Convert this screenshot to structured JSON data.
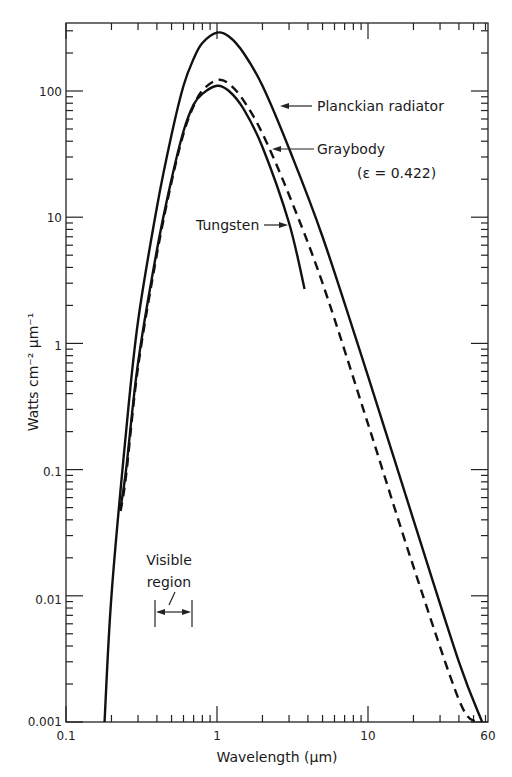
{
  "chart_data": {
    "type": "line",
    "title": "",
    "xlabel": "Wavelength (μm)",
    "ylabel": "Watts cm⁻² μm⁻¹",
    "xscale": "log",
    "yscale": "log",
    "xlim": [
      0.1,
      60
    ],
    "ylim": [
      0.001,
      300
    ],
    "grid": false,
    "x_tick_labels": [
      "0.1",
      "1",
      "10",
      "60"
    ],
    "y_tick_labels": [
      "0.001",
      "0.01",
      "0.1",
      "1",
      "10",
      "100"
    ],
    "series": [
      {
        "name": "Planckian radiator",
        "style": "solid",
        "x": [
          0.18,
          0.2,
          0.25,
          0.3,
          0.4,
          0.5,
          0.6,
          0.7,
          0.8,
          1.0,
          1.2,
          1.5,
          2.0,
          3.0,
          5.0,
          10,
          20,
          40,
          57
        ],
        "y": [
          0.001,
          0.01,
          0.2,
          1.5,
          12,
          45,
          110,
          180,
          240,
          290,
          270,
          200,
          110,
          35,
          7,
          0.55,
          0.04,
          0.003,
          0.001
        ]
      },
      {
        "name": "Graybody (ε = 0.422)",
        "style": "dashed",
        "x": [
          0.23,
          0.25,
          0.3,
          0.4,
          0.5,
          0.6,
          0.7,
          0.8,
          1.0,
          1.2,
          1.5,
          2.0,
          3.0,
          5.0,
          10,
          20,
          40,
          52
        ],
        "y": [
          0.047,
          0.09,
          0.65,
          5.1,
          19,
          46,
          76,
          101,
          122,
          114,
          84,
          46,
          15,
          3,
          0.23,
          0.017,
          0.0015,
          0.001
        ]
      },
      {
        "name": "Tungsten",
        "style": "solid",
        "x": [
          0.23,
          0.25,
          0.3,
          0.4,
          0.5,
          0.6,
          0.7,
          0.8,
          1.0,
          1.2,
          1.5,
          2.0,
          3.0,
          3.8
        ],
        "y": [
          0.05,
          0.1,
          0.7,
          5.5,
          20,
          48,
          78,
          95,
          110,
          100,
          72,
          36,
          9,
          2.7
        ]
      }
    ],
    "annotations": [
      {
        "text": "Planckian radiator",
        "arrow_to_series": "Planckian radiator"
      },
      {
        "text": "Graybody",
        "arrow_to_series": "Graybody (ε = 0.422)"
      },
      {
        "text": "(ε  = 0.422)"
      },
      {
        "text": "Tungsten",
        "arrow_to_series": "Tungsten"
      },
      {
        "text": "Visible region",
        "range_um": [
          0.4,
          0.7
        ]
      }
    ]
  },
  "labels": {
    "xlabel": "Wavelength (μm)",
    "ylabel": "Watts cm⁻² μm⁻¹",
    "planck": "Planckian radiator",
    "graybody": "Graybody",
    "emissivity": "(ε  = 0.422)",
    "tungsten": "Tungsten",
    "visible1": "Visible",
    "visible2": "region",
    "xt0": "0.1",
    "xt1": "1",
    "xt2": "10",
    "xt3": "60",
    "yt0": "0.001",
    "yt1": "0.01",
    "yt2": "0.1",
    "yt3": "1",
    "yt4": "10",
    "yt5": "100"
  }
}
